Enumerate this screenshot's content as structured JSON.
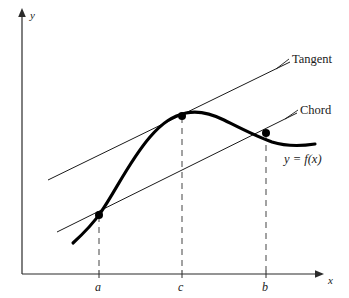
{
  "figure": {
    "background_color": "#ffffff",
    "ink_color": "#1a1a1a",
    "curve_color": "#000000",
    "dash_color": "#8a8a8a",
    "axes": {
      "x_label": "x",
      "y_label": "y",
      "origin": [
        22,
        274
      ],
      "x_axis_end": [
        322,
        274
      ],
      "y_axis_top": [
        22,
        12
      ]
    },
    "ticks": [
      {
        "label": "a",
        "x": 99
      },
      {
        "label": "c",
        "x": 182
      },
      {
        "label": "b",
        "x": 266
      }
    ],
    "callouts": [
      {
        "name": "tangent",
        "text": "Tangent",
        "x": 292,
        "y": 53
      },
      {
        "name": "chord",
        "text": "Chord",
        "x": 300,
        "y": 104
      },
      {
        "name": "function",
        "text": "y = f(x)",
        "x": 284,
        "y": 153
      }
    ],
    "points": [
      {
        "name": "point-a",
        "x": 99,
        "y": 215
      },
      {
        "name": "point-c",
        "x": 182,
        "y": 116
      },
      {
        "name": "point-b",
        "x": 266,
        "y": 133
      }
    ],
    "lines": {
      "tangent": {
        "x1": 48,
        "y1": 180,
        "x2": 290,
        "y2": 62
      },
      "chord": {
        "x1": 57,
        "y1": 232,
        "x2": 297,
        "y2": 113
      }
    },
    "curve": {
      "description": "increasing concave-up then concave-down hump peaking near x=200, falling to the right",
      "path": "M 73 243 C 85 232 93 224 101 212 C 115 192 130 160 150 137 C 163 122 173 116 186 113 C 200 110 212 114 224 120 C 240 128 255 136 272 142 C 288 147 302 146 315 144"
    }
  }
}
